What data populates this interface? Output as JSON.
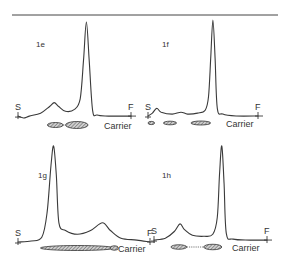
{
  "figure": {
    "panels": [
      {
        "id": "1e",
        "label": "1e",
        "start_label": "S",
        "front_label": "F",
        "carrier_label": "Carrier",
        "trace": [
          [
            0,
            0.02
          ],
          [
            0.05,
            0.0
          ],
          [
            0.1,
            0.02
          ],
          [
            0.2,
            0.05
          ],
          [
            0.28,
            0.12
          ],
          [
            0.32,
            0.16
          ],
          [
            0.36,
            0.12
          ],
          [
            0.42,
            0.07
          ],
          [
            0.5,
            0.09
          ],
          [
            0.55,
            0.2
          ],
          [
            0.58,
            0.6
          ],
          [
            0.605,
            1.0
          ],
          [
            0.63,
            0.6
          ],
          [
            0.66,
            0.08
          ],
          [
            0.7,
            0.03
          ],
          [
            0.8,
            0.02
          ],
          [
            1.0,
            0.02
          ]
        ],
        "spots": [
          {
            "center": 0.33,
            "width": 0.14,
            "height": 1.0
          },
          {
            "center": 0.52,
            "width": 0.2,
            "height": 1.4
          }
        ],
        "spot_links": [
          [
            0.4,
            0.42
          ]
        ]
      },
      {
        "id": "1f",
        "label": "1f",
        "start_label": "S",
        "front_label": "F",
        "carrier_label": "Carrier",
        "trace": [
          [
            0,
            0.0
          ],
          [
            0.04,
            0.03
          ],
          [
            0.08,
            0.08
          ],
          [
            0.12,
            0.04
          ],
          [
            0.22,
            0.02
          ],
          [
            0.3,
            0.04
          ],
          [
            0.36,
            0.02
          ],
          [
            0.45,
            0.03
          ],
          [
            0.52,
            0.06
          ],
          [
            0.55,
            0.2
          ],
          [
            0.57,
            0.6
          ],
          [
            0.59,
            1.0
          ],
          [
            0.61,
            0.6
          ],
          [
            0.63,
            0.08
          ],
          [
            0.68,
            0.02
          ],
          [
            0.8,
            0.0
          ],
          [
            1.0,
            0.0
          ]
        ],
        "spots": [
          {
            "center": 0.03,
            "width": 0.06,
            "height": 0.8
          },
          {
            "center": 0.2,
            "width": 0.12,
            "height": 0.9
          },
          {
            "center": 0.48,
            "width": 0.18,
            "height": 1.0
          }
        ],
        "spot_links": []
      },
      {
        "id": "1g",
        "label": "1g",
        "start_label": "S",
        "front_label": "F",
        "carrier_label": "Carrier",
        "trace": [
          [
            0,
            0.0
          ],
          [
            0.1,
            0.01
          ],
          [
            0.18,
            0.05
          ],
          [
            0.22,
            0.3
          ],
          [
            0.25,
            0.8
          ],
          [
            0.27,
            1.0
          ],
          [
            0.29,
            0.7
          ],
          [
            0.31,
            0.2
          ],
          [
            0.36,
            0.12
          ],
          [
            0.45,
            0.08
          ],
          [
            0.55,
            0.12
          ],
          [
            0.64,
            0.2
          ],
          [
            0.7,
            0.12
          ],
          [
            0.78,
            0.04
          ],
          [
            0.9,
            0.02
          ],
          [
            1.0,
            0.0
          ]
        ],
        "spots": [
          {
            "center": 0.45,
            "width": 0.56,
            "height": 1.0
          },
          {
            "center": 0.73,
            "width": 0.06,
            "height": 0.9
          }
        ],
        "spot_links": []
      },
      {
        "id": "1h",
        "label": "1h",
        "start_label": "S",
        "front_label": "F",
        "carrier_label": "Carrier",
        "trace": [
          [
            0,
            0.01
          ],
          [
            0.1,
            0.03
          ],
          [
            0.18,
            0.1
          ],
          [
            0.23,
            0.18
          ],
          [
            0.27,
            0.12
          ],
          [
            0.34,
            0.06
          ],
          [
            0.44,
            0.05
          ],
          [
            0.52,
            0.07
          ],
          [
            0.56,
            0.25
          ],
          [
            0.58,
            0.7
          ],
          [
            0.6,
            1.0
          ],
          [
            0.62,
            0.6
          ],
          [
            0.64,
            0.08
          ],
          [
            0.7,
            0.02
          ],
          [
            0.85,
            0.01
          ],
          [
            1.0,
            0.01
          ]
        ],
        "spots": [
          {
            "center": 0.22,
            "width": 0.14,
            "height": 0.9
          },
          {
            "center": 0.52,
            "width": 0.16,
            "height": 1.1
          }
        ],
        "spot_links": [
          [
            0.29,
            0.44
          ]
        ]
      }
    ]
  }
}
